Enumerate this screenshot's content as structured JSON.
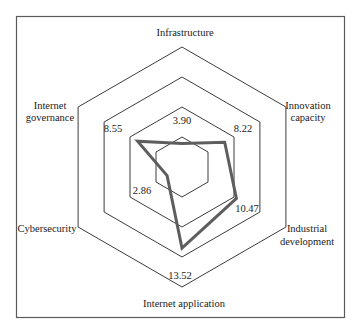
{
  "chart_data": {
    "type": "radar",
    "title": "",
    "categories": [
      "Infrastructure",
      "Innovation capacity",
      "Industrial development",
      "Internet application",
      "Cybersecurity",
      "Internet governance"
    ],
    "axis_label_lines": [
      [
        "Infrastructure"
      ],
      [
        "Innovation",
        "capacity"
      ],
      [
        "Industrial",
        "development"
      ],
      [
        "Internet application"
      ],
      [
        "Cybersecurity"
      ],
      [
        "Internet",
        "governance"
      ]
    ],
    "series": [
      {
        "name": "",
        "values": [
          3.9,
          8.22,
          10.47,
          13.52,
          2.86,
          8.55
        ]
      }
    ],
    "value_labels": [
      "3.90",
      "8.22",
      "10.47",
      "13.52",
      "2.86",
      "8.55"
    ],
    "grid_levels": [
      5,
      10,
      15,
      20
    ],
    "rlim": [
      0,
      20
    ],
    "grid": true,
    "legend": false
  },
  "colors": {
    "series": "#5e5e5e",
    "grid": "#3c3c3c",
    "frame": "#5a5a5a",
    "background": "#ffffff"
  }
}
